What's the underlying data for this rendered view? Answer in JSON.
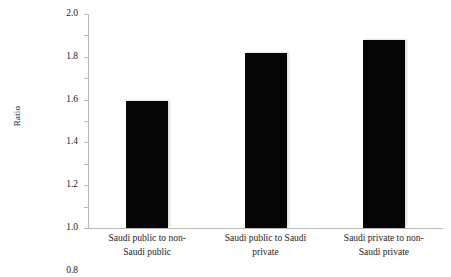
{
  "chart_data": {
    "type": "bar",
    "title": "",
    "xlabel": "",
    "ylabel": "Ratio",
    "categories": [
      "Saudi public to non-Saudi public",
      "Saudi public to Saudi private",
      "Saudi private to non-Saudi private"
    ],
    "values": [
      1.19,
      1.64,
      1.76
    ],
    "ylim": [
      0,
      2.0
    ],
    "yticks": [
      0,
      0.2,
      0.4,
      0.6,
      0.8,
      1.0,
      1.2,
      1.4,
      1.6,
      1.8,
      2.0
    ],
    "ytick_labels": [
      "0",
      "0.2",
      "0.4",
      "0.6",
      "0.8",
      "1.0",
      "1.2",
      "1.4",
      "1.6",
      "1.8",
      "2.0"
    ],
    "grid": false,
    "legend": null,
    "bar_color": "#050505",
    "axis_color": "#b9b9b9",
    "text_color": "#1a1a1a"
  },
  "xlabel_lines": [
    [
      "Saudi public to non-",
      "Saudi public"
    ],
    [
      "Saudi public to Saudi",
      "private"
    ],
    [
      "Saudi private to non-",
      "Saudi private"
    ]
  ]
}
